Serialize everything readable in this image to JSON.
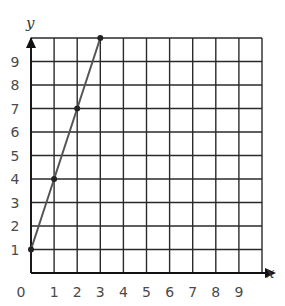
{
  "chart_data": {
    "type": "line",
    "title": "",
    "xlabel": "x",
    "ylabel": "y",
    "xlim": [
      0,
      10
    ],
    "ylim": [
      0,
      10
    ],
    "grid": true,
    "x_ticks": [
      "0",
      "1",
      "2",
      "3",
      "4",
      "5",
      "6",
      "7",
      "8",
      "9"
    ],
    "y_ticks": [
      "1",
      "2",
      "3",
      "4",
      "5",
      "6",
      "7",
      "8",
      "9"
    ],
    "series": [
      {
        "name": "line",
        "x": [
          0,
          1,
          2,
          3
        ],
        "y": [
          1,
          4,
          7,
          10
        ],
        "color": "#555555"
      }
    ],
    "annotations": []
  }
}
